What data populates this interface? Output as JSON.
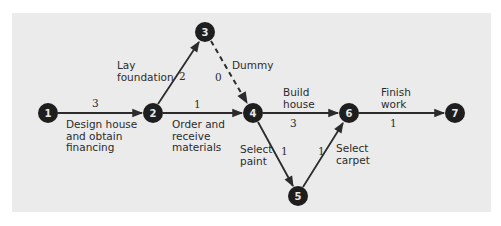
{
  "diagram": {
    "type": "activity-on-arrow network",
    "colors": {
      "background": "#ebebeb",
      "node_fill": "#1e1e1e",
      "node_text": "#e8e8e8",
      "arrow": "#2b2b2b",
      "text": "#2b2b2b"
    },
    "nodes": [
      {
        "id": "1",
        "label": "1"
      },
      {
        "id": "2",
        "label": "2"
      },
      {
        "id": "3",
        "label": "3"
      },
      {
        "id": "4",
        "label": "4"
      },
      {
        "id": "5",
        "label": "5"
      },
      {
        "id": "6",
        "label": "6"
      },
      {
        "id": "7",
        "label": "7"
      }
    ],
    "activities": [
      {
        "from": "1",
        "to": "2",
        "name": "Design house\nand obtain\nfinancing",
        "duration": "3",
        "style": "solid"
      },
      {
        "from": "2",
        "to": "3",
        "name": "Lay\nfoundation",
        "duration": "2",
        "style": "solid"
      },
      {
        "from": "2",
        "to": "4",
        "name": "Order and\nreceive\nmaterials",
        "duration": "1",
        "style": "solid"
      },
      {
        "from": "3",
        "to": "4",
        "name": "Dummy",
        "duration": "0",
        "style": "dashed"
      },
      {
        "from": "4",
        "to": "6",
        "name": "Build\nhouse",
        "duration": "3",
        "style": "solid"
      },
      {
        "from": "4",
        "to": "5",
        "name": "Select\npaint",
        "duration": "1",
        "style": "solid"
      },
      {
        "from": "5",
        "to": "6",
        "name": "Select\ncarpet",
        "duration": "1",
        "style": "solid"
      },
      {
        "from": "6",
        "to": "7",
        "name": "Finish\nwork",
        "duration": "1",
        "style": "solid"
      }
    ]
  }
}
